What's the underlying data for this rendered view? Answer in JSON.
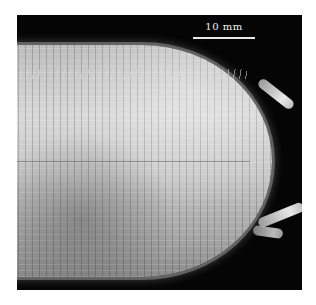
{
  "figure": {
    "background_color": "#050505",
    "specimen_color": "#c9c9c9",
    "scale_bar": {
      "label": "10 mm",
      "color": "#e8e8e8"
    }
  }
}
